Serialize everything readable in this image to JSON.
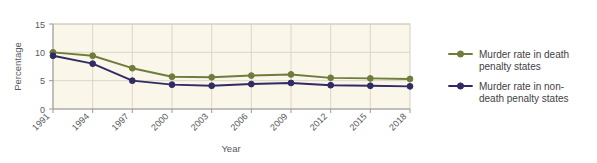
{
  "chart_data": {
    "type": "line",
    "title": "",
    "xlabel": "Year",
    "ylabel": "Percentage",
    "categories": [
      "1991",
      "1994",
      "1997",
      "2000",
      "2003",
      "2006",
      "2009",
      "2012",
      "2015",
      "2018"
    ],
    "x": [
      1991,
      1994,
      1997,
      2000,
      2003,
      2006,
      2009,
      2012,
      2015,
      2018
    ],
    "ylim": [
      0,
      15
    ],
    "yticks": [
      "0",
      "5",
      "10",
      "15"
    ],
    "ytick_values": [
      0,
      5,
      10,
      15
    ],
    "grid": true,
    "legend_position": "right",
    "plot_background": "#faf6ea",
    "series": [
      {
        "name": "Murder rate in death penalty states",
        "color": "#6f7d3c",
        "marker": "circle",
        "values": [
          10.0,
          9.4,
          7.2,
          5.7,
          5.6,
          5.9,
          6.1,
          5.5,
          5.4,
          5.3
        ]
      },
      {
        "name": "Murder rate in non-death penalty states",
        "color": "#312b63",
        "marker": "circle",
        "values": [
          9.4,
          8.0,
          5.0,
          4.3,
          4.1,
          4.4,
          4.6,
          4.2,
          4.1,
          4.0
        ]
      }
    ]
  },
  "legend": {
    "items": [
      {
        "label_line1": "Murder rate in death",
        "label_line2": "penalty states"
      },
      {
        "label_line1": "Murder rate in non-",
        "label_line2": "death penalty states"
      }
    ]
  },
  "axes": {
    "y_title": "Percentage",
    "x_title": "Year",
    "y_tick_0": "0",
    "y_tick_5": "5",
    "y_tick_10": "10",
    "y_tick_15": "15",
    "x_tick_0": "1991",
    "x_tick_1": "1994",
    "x_tick_2": "1997",
    "x_tick_3": "2000",
    "x_tick_4": "2003",
    "x_tick_5": "2006",
    "x_tick_6": "2009",
    "x_tick_7": "2012",
    "x_tick_8": "2015",
    "x_tick_9": "2018"
  }
}
